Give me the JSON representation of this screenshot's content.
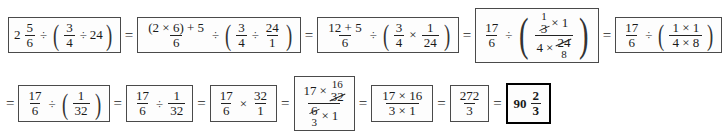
{
  "document": {
    "type": "math-worksheet-solution",
    "title": "Step-by-step solution",
    "problem": "2 5/6 ÷ (3/4 ÷ 24)",
    "answer": "90 2/3"
  },
  "symbols": {
    "equals": "=",
    "divide": "÷",
    "multiply": "×",
    "plus": "+",
    "paren_open": "(",
    "paren_close": ")"
  },
  "row1": {
    "step1": {
      "whole": "2",
      "frac_num": "5",
      "frac_den": "6",
      "op1": "÷",
      "inner_num": "3",
      "inner_den": "4",
      "op2": "÷",
      "inner_value": "24"
    },
    "step2": {
      "left_num": "(2 × 6) + 5",
      "left_den": "6",
      "op1": "÷",
      "a_num": "3",
      "a_den": "4",
      "op2": "÷",
      "b_num": "24",
      "b_den": "1"
    },
    "step3": {
      "left_num": "12 + 5",
      "left_den": "6",
      "op1": "÷",
      "a_num": "3",
      "a_den": "4",
      "op2": "×",
      "b_num": "1",
      "b_den": "24"
    },
    "step4": {
      "left_num": "17",
      "left_den": "6",
      "op1": "÷",
      "num_cancel_over": "1",
      "num_cancel_value": "3",
      "num_mult": "×",
      "num_other": "1",
      "den_first": "4",
      "den_mult": "×",
      "den_cancel_value": "24",
      "den_cancel_under": "8"
    },
    "step5": {
      "left_num": "17",
      "left_den": "6",
      "op1": "÷",
      "inner_num": "1 × 1",
      "inner_den": "4 × 8"
    }
  },
  "row2": {
    "step6": {
      "left_num": "17",
      "left_den": "6",
      "op1": "÷",
      "inner_num": "1",
      "inner_den": "32"
    },
    "step7": {
      "left_num": "17",
      "left_den": "6",
      "op1": "÷",
      "right_num": "1",
      "right_den": "32"
    },
    "step8": {
      "left_num": "17",
      "left_den": "6",
      "op1": "×",
      "right_num": "32",
      "right_den": "1"
    },
    "step9": {
      "num_first": "17",
      "num_mult": "×",
      "num_cancel_over": "16",
      "num_cancel_value": "32",
      "den_cancel_value": "6",
      "den_cancel_under": "3",
      "den_mult": "×",
      "den_other": "1"
    },
    "step10": {
      "num": "17 × 16",
      "den": "3 × 1"
    },
    "step11": {
      "num": "272",
      "den": "3"
    },
    "step12": {
      "whole": "90",
      "frac_num": "2",
      "frac_den": "3"
    }
  }
}
